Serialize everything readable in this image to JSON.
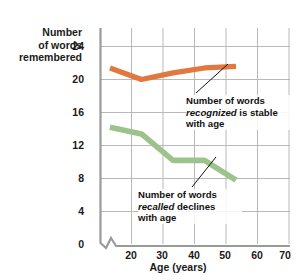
{
  "chart_data": {
    "type": "line",
    "title": "",
    "xlabel": "Age (years)",
    "ylabel": "Number of words remembered",
    "ylabel_lines": [
      "Number",
      "of words",
      "remembered"
    ],
    "x": [
      20,
      30,
      40,
      50,
      60
    ],
    "xlim": [
      15,
      70
    ],
    "ylim": [
      0,
      26
    ],
    "xticks": [
      20,
      30,
      40,
      50,
      60,
      70
    ],
    "yticks": [
      0,
      4,
      8,
      12,
      16,
      20,
      24
    ],
    "xtick_labels": [
      "20",
      "30",
      "40",
      "50",
      "60",
      "70"
    ],
    "ytick_labels": [
      "0",
      "4",
      "8",
      "12",
      "16",
      "20",
      "24"
    ],
    "grid": true,
    "legend": "none",
    "axis_break": true,
    "series": [
      {
        "name": "Number of words recognized",
        "color": "#E0783F",
        "values": [
          21.4,
          20.0,
          20.8,
          21.4,
          21.6
        ]
      },
      {
        "name": "Number of words recalled",
        "color": "#9DC38C",
        "values": [
          14.2,
          13.4,
          10.2,
          10.2,
          7.8
        ]
      }
    ],
    "annotations": [
      {
        "id": "recognized",
        "lines": [
          [
            {
              "t": "Number of words",
              "style": "normal"
            }
          ],
          [
            {
              "t": "recognized",
              "style": "italic"
            },
            {
              "t": " is stable",
              "style": "normal"
            }
          ],
          [
            {
              "t": "with age",
              "style": "normal"
            }
          ]
        ],
        "leader_from": [
          196,
          93
        ],
        "leader_to": [
          228,
          64
        ]
      },
      {
        "id": "recalled",
        "lines": [
          [
            {
              "t": "Number of words",
              "style": "normal"
            }
          ],
          [
            {
              "t": "recalled",
              "style": "italic"
            },
            {
              "t": " declines",
              "style": "normal"
            }
          ],
          [
            {
              "t": "with age",
              "style": "normal"
            }
          ]
        ],
        "leader_from": [
          192,
          187
        ],
        "leader_to": [
          216,
          157
        ]
      }
    ]
  },
  "colors": {
    "recognized_line": "#E0783F",
    "recalled_line": "#9DC38C",
    "grid": "#b9b9b9",
    "axis": "#9a9a9a",
    "text": "#1a1a1a",
    "background": "#ffffff"
  }
}
